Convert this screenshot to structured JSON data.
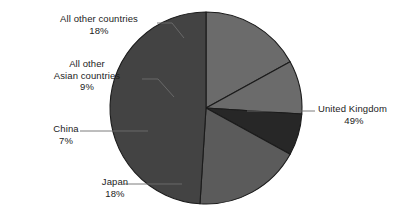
{
  "chart_data": {
    "type": "pie",
    "title": "",
    "subtitle": "",
    "legend_position": "none",
    "grid": false,
    "labels_outside": true,
    "leader_lines": true,
    "total_percent": 101,
    "categories": [
      "United Kingdom",
      "Japan",
      "China",
      "All other Asian countries",
      "All other countries"
    ],
    "values": [
      49,
      18,
      7,
      9,
      18
    ],
    "value_suffix": "%",
    "slices": [
      {
        "name": "United Kingdom",
        "value": 49,
        "value_label": "49%",
        "color": "#434343",
        "start_angle_deg": 0,
        "end_angle_deg": 176.4,
        "label_side": "right"
      },
      {
        "name": "Japan",
        "value": 18,
        "value_label": "18%",
        "color": "#5b5b5b",
        "start_angle_deg": 176.4,
        "end_angle_deg": 241.2,
        "label_side": "left"
      },
      {
        "name": "China",
        "value": 7,
        "value_label": "7%",
        "color": "#272727",
        "start_angle_deg": 241.2,
        "end_angle_deg": 266.4,
        "label_side": "left"
      },
      {
        "name": "All other Asian countries",
        "value": 9,
        "value_label": "9%",
        "color": "#6b6b6b",
        "start_angle_deg": 266.4,
        "end_angle_deg": 298.8,
        "label_side": "left"
      },
      {
        "name": "All other countries",
        "value": 18,
        "value_label": "18%",
        "color": "#6b6b6b",
        "start_angle_deg": 298.8,
        "end_angle_deg": 360,
        "label_side": "left"
      }
    ],
    "geometry": {
      "center_x": 206,
      "center_y": 108,
      "radius": 96
    },
    "style": {
      "background": "#ffffff",
      "slice_border": "#1b1b1b",
      "text_color": "#1b1b1b",
      "leader_line_color": "#6d6d6d"
    }
  },
  "labels": {
    "all_other_countries": {
      "name": "All other countries",
      "value": "18%"
    },
    "all_other_asian": {
      "name_line1": "All other",
      "name_line2": "Asian countries",
      "value": "9%"
    },
    "china": {
      "name": "China",
      "value": "7%"
    },
    "japan": {
      "name": "Japan",
      "value": "18%"
    },
    "united_kingdom": {
      "name": "United Kingdom",
      "value": "49%"
    }
  }
}
